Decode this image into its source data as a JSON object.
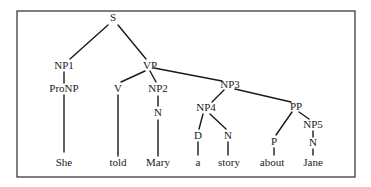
{
  "diagram": {
    "type": "syntax-parse-tree",
    "frame": {
      "x": 17,
      "y": 11,
      "width": 338,
      "height": 166,
      "stroke": "#3a3a3a"
    },
    "nodes": [
      {
        "id": "S",
        "label": "S",
        "x": 113,
        "y": 18
      },
      {
        "id": "NP1",
        "label": "NP1",
        "x": 64,
        "y": 66
      },
      {
        "id": "VP",
        "label": "VP",
        "x": 150,
        "y": 66
      },
      {
        "id": "ProNP",
        "label": "ProNP",
        "x": 64,
        "y": 89
      },
      {
        "id": "V",
        "label": "V",
        "x": 118,
        "y": 89
      },
      {
        "id": "NP2",
        "label": "NP2",
        "x": 158,
        "y": 89
      },
      {
        "id": "N_NP2",
        "label": "N",
        "x": 158,
        "y": 113
      },
      {
        "id": "NP3",
        "label": "NP3",
        "x": 230,
        "y": 85
      },
      {
        "id": "NP4",
        "label": "NP4",
        "x": 206,
        "y": 108
      },
      {
        "id": "PP",
        "label": "PP",
        "x": 296,
        "y": 107
      },
      {
        "id": "D",
        "label": "D",
        "x": 198,
        "y": 136
      },
      {
        "id": "N_NP4",
        "label": "N",
        "x": 228,
        "y": 136
      },
      {
        "id": "P",
        "label": "P",
        "x": 274,
        "y": 142
      },
      {
        "id": "NP5",
        "label": "NP5",
        "x": 313,
        "y": 125
      },
      {
        "id": "N_NP5",
        "label": "N",
        "x": 313,
        "y": 143
      }
    ],
    "words": [
      {
        "id": "w_she",
        "label": "She",
        "x": 64,
        "y": 163
      },
      {
        "id": "w_told",
        "label": "told",
        "x": 118,
        "y": 163
      },
      {
        "id": "w_mary",
        "label": "Mary",
        "x": 158,
        "y": 163
      },
      {
        "id": "w_a",
        "label": "a",
        "x": 198,
        "y": 163
      },
      {
        "id": "w_story",
        "label": "story",
        "x": 229,
        "y": 163
      },
      {
        "id": "w_about",
        "label": "about",
        "x": 272,
        "y": 163
      },
      {
        "id": "w_jane",
        "label": "Jane",
        "x": 313,
        "y": 163
      }
    ],
    "edges": [
      {
        "from": "S",
        "to": "NP1",
        "x1": 108,
        "y1": 25,
        "x2": 70,
        "y2": 59
      },
      {
        "from": "S",
        "to": "VP",
        "x1": 118,
        "y1": 25,
        "x2": 146,
        "y2": 59
      },
      {
        "from": "NP1",
        "to": "ProNP",
        "x1": 64,
        "y1": 72,
        "x2": 64,
        "y2": 83
      },
      {
        "from": "ProNP",
        "to": "She",
        "x1": 64,
        "y1": 95,
        "x2": 64,
        "y2": 152
      },
      {
        "from": "VP",
        "to": "V",
        "x1": 145,
        "y1": 71,
        "x2": 121,
        "y2": 82
      },
      {
        "from": "VP",
        "to": "NP2",
        "x1": 150,
        "y1": 71,
        "x2": 156,
        "y2": 82
      },
      {
        "from": "VP",
        "to": "NP3",
        "x1": 154,
        "y1": 68,
        "x2": 222,
        "y2": 81
      },
      {
        "from": "V",
        "to": "told",
        "x1": 118,
        "y1": 95,
        "x2": 118,
        "y2": 156
      },
      {
        "from": "NP2",
        "to": "N",
        "x1": 158,
        "y1": 96,
        "x2": 158,
        "y2": 106
      },
      {
        "from": "N",
        "to": "Mary",
        "x1": 158,
        "y1": 120,
        "x2": 158,
        "y2": 156
      },
      {
        "from": "NP3",
        "to": "NP4",
        "x1": 224,
        "y1": 90,
        "x2": 212,
        "y2": 102
      },
      {
        "from": "NP3",
        "to": "PP",
        "x1": 235,
        "y1": 89,
        "x2": 291,
        "y2": 102
      },
      {
        "from": "NP4",
        "to": "D",
        "x1": 203,
        "y1": 114,
        "x2": 199,
        "y2": 129
      },
      {
        "from": "NP4",
        "to": "N",
        "x1": 210,
        "y1": 114,
        "x2": 226,
        "y2": 129
      },
      {
        "from": "D",
        "to": "a",
        "x1": 198,
        "y1": 142,
        "x2": 198,
        "y2": 155
      },
      {
        "from": "N",
        "to": "story",
        "x1": 228,
        "y1": 142,
        "x2": 228,
        "y2": 155
      },
      {
        "from": "PP",
        "to": "P",
        "x1": 292,
        "y1": 112,
        "x2": 276,
        "y2": 135
      },
      {
        "from": "PP",
        "to": "NP5",
        "x1": 299,
        "y1": 112,
        "x2": 309,
        "y2": 119
      },
      {
        "from": "NP5",
        "to": "N",
        "x1": 313,
        "y1": 131,
        "x2": 313,
        "y2": 137
      },
      {
        "from": "P",
        "to": "about",
        "x1": 274,
        "y1": 148,
        "x2": 274,
        "y2": 155
      },
      {
        "from": "N",
        "to": "Jane",
        "x1": 313,
        "y1": 149,
        "x2": 313,
        "y2": 155
      }
    ]
  }
}
